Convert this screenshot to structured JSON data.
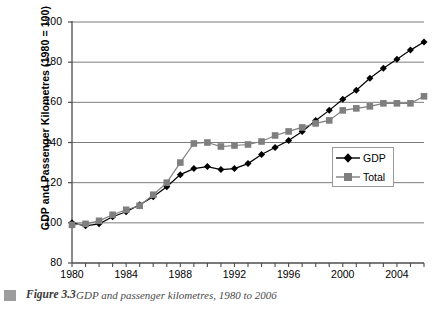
{
  "chart_data": {
    "type": "line",
    "title": "",
    "xlabel": "",
    "ylabel": "GDP and Passenger Kilometres (1980 = 100)",
    "xlim": [
      1980,
      2006
    ],
    "ylim": [
      80,
      200
    ],
    "yticks": [
      80,
      100,
      120,
      140,
      160,
      180,
      200
    ],
    "xticks": [
      1980,
      1984,
      1988,
      1992,
      1996,
      2000,
      2004
    ],
    "xtick_minor_every": 1,
    "grid": "horizontal",
    "legend_position": "inside-right",
    "x": [
      1980,
      1981,
      1982,
      1983,
      1984,
      1985,
      1986,
      1987,
      1988,
      1989,
      1990,
      1991,
      1992,
      1993,
      1994,
      1995,
      1996,
      1997,
      1998,
      1999,
      2000,
      2001,
      2002,
      2003,
      2004,
      2005,
      2006
    ],
    "series": [
      {
        "name": "GDP",
        "marker": "diamond",
        "color": "#000000",
        "values": [
          100,
          98.5,
          99.5,
          103,
          105.5,
          109,
          113,
          118,
          124,
          127,
          128,
          126.5,
          127,
          129.5,
          134,
          137.5,
          141,
          145.5,
          151,
          156,
          161.5,
          166,
          172,
          177,
          181.5,
          186,
          190
        ]
      },
      {
        "name": "Total",
        "marker": "square",
        "color": "#7f7f7f",
        "values": [
          99,
          99.5,
          101,
          104,
          106.5,
          108.5,
          114,
          120,
          130,
          139.5,
          140,
          138,
          138.5,
          139,
          140.5,
          143.5,
          145.5,
          147.5,
          149.5,
          151,
          156,
          157,
          158,
          159.5,
          159.5,
          159.5,
          163
        ]
      }
    ]
  },
  "legend": {
    "entries": [
      {
        "label": "GDP"
      },
      {
        "label": "Total"
      }
    ]
  },
  "caption": {
    "figure_number": "Figure 3.3",
    "text": "GDP and passenger kilometres, 1980 to 2006"
  },
  "colors": {
    "gdp": "#000000",
    "total": "#7f7f7f",
    "axis": "#4d4d4d",
    "grid": "#6e6e6e",
    "caption_marker": "#9d9d9d"
  }
}
